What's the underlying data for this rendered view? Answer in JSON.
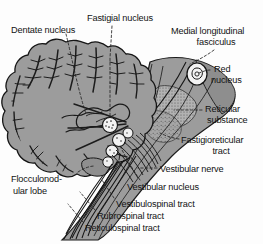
{
  "figure": {
    "type": "anatomical-diagram",
    "background_color": "#fdfdfd",
    "tissue_color": "#9a9a9a",
    "outline_color": "#1a1a1a",
    "label_color": "#131313"
  },
  "labels": [
    {
      "id": "dentate-nucleus",
      "text": "Dentate nucleus",
      "x": 11,
      "y": 25,
      "align": "left"
    },
    {
      "id": "fastigial-nucleus",
      "text": "Fastigial nucleus",
      "x": 87,
      "y": 13,
      "align": "left"
    },
    {
      "id": "medial-longitudinal",
      "text": "Medial longitudinal",
      "x": 171,
      "y": 26,
      "align": "left"
    },
    {
      "id": "fasciculus",
      "text": "fasciculus",
      "x": 171,
      "y": 37,
      "align": "center"
    },
    {
      "id": "red",
      "text": "Red",
      "x": 214,
      "y": 64,
      "align": "left"
    },
    {
      "id": "red-nucleus",
      "text": "nucleus",
      "x": 211,
      "y": 75,
      "align": "left"
    },
    {
      "id": "reticular",
      "text": "Reticular",
      "x": 205,
      "y": 104,
      "align": "left"
    },
    {
      "id": "reticular-substance",
      "text": "substance",
      "x": 207,
      "y": 115,
      "align": "left"
    },
    {
      "id": "fastigioreticular",
      "text": "Fastigioreticular",
      "x": 181,
      "y": 135,
      "align": "left"
    },
    {
      "id": "fastigioreticular-tract",
      "text": "tract",
      "x": 181,
      "y": 146,
      "align": "center"
    },
    {
      "id": "vestibular-nerve",
      "text": "Vestibular nerve",
      "x": 160,
      "y": 164,
      "align": "left"
    },
    {
      "id": "vestibular-nucleus",
      "text": "Vestibular nucleus",
      "x": 127,
      "y": 182,
      "align": "left"
    },
    {
      "id": "flocculonodular-1",
      "text": "Flocculonod-",
      "x": 11,
      "y": 174,
      "align": "left"
    },
    {
      "id": "flocculonodular-2",
      "text": "ular lobe",
      "x": 13,
      "y": 186,
      "align": "left"
    },
    {
      "id": "vestibulospinal-tract",
      "text": "Vestibulospinal tract",
      "x": 116,
      "y": 199,
      "align": "left"
    },
    {
      "id": "rubrospinal-tract",
      "text": "Rubrospinal tract",
      "x": 97,
      "y": 211,
      "align": "left"
    },
    {
      "id": "reticulospinal-tract",
      "text": "Reticulospinal tract",
      "x": 85,
      "y": 223,
      "align": "left"
    }
  ],
  "structures": [
    {
      "id": "cerebellum",
      "name": "cerebellum-body"
    },
    {
      "id": "brainstem",
      "name": "brainstem-body"
    },
    {
      "id": "red-nucleus-mark",
      "name": "red-nucleus-marker"
    },
    {
      "id": "fastigial-mark",
      "name": "fastigial-nucleus-marker"
    },
    {
      "id": "vestibular-mark",
      "name": "vestibular-nucleus-marker"
    },
    {
      "id": "vestibular-nerve-fibers",
      "name": "vestibular-nerve-fibers"
    },
    {
      "id": "descending-tracts",
      "name": "descending-tract-bundle"
    },
    {
      "id": "arbor-vitae",
      "name": "arbor-vitae-branching"
    }
  ]
}
